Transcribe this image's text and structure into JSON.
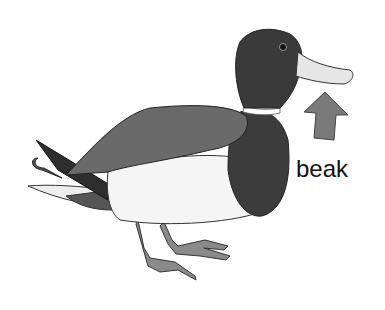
{
  "illustration": {
    "subject": "mallard duck",
    "label": "beak",
    "arrow_direction": "up",
    "colors": {
      "head": "#3a3a3a",
      "beak": "#e6e6e6",
      "wing": "#6a6a6a",
      "breast": "#3c3c3c",
      "belly": "#f4f4f4",
      "legs": "#8a8a8a",
      "arrow": "#7a7a7a",
      "outline": "#222222"
    }
  }
}
